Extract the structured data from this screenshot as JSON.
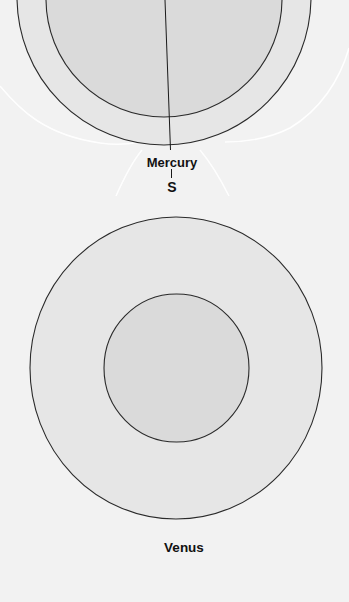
{
  "figure": {
    "type": "planetary interior comparison diagram",
    "colors": {
      "background": "#f2f2f2",
      "mantle_fill": "#e6e6e6",
      "core_fill": "#dadada",
      "outline": "#2a2a2a",
      "field_lines": "#ffffff"
    }
  },
  "planets": [
    {
      "name": "Mercury",
      "label": "Mercury",
      "pole_label": "S",
      "layers": [
        "outer shell",
        "core"
      ],
      "has_magnetic_field_lines": true,
      "has_axis_line": true
    },
    {
      "name": "Venus",
      "label": "Venus",
      "layers": [
        "outer shell",
        "core"
      ],
      "has_magnetic_field_lines": false,
      "has_axis_line": false
    }
  ]
}
